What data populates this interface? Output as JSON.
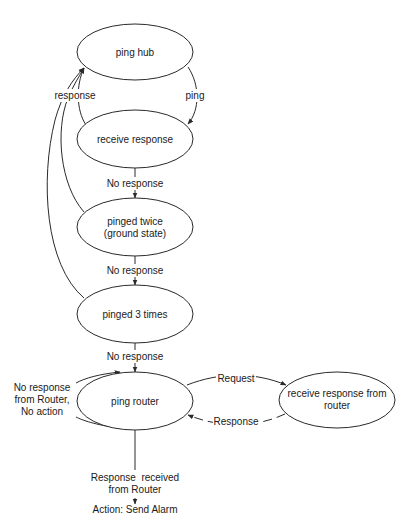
{
  "diagram": {
    "type": "state-machine",
    "nodes": [
      {
        "id": "ping_hub",
        "label": "ping hub"
      },
      {
        "id": "receive_response",
        "label": "receive response"
      },
      {
        "id": "pinged_twice",
        "label_line1": "pinged twice",
        "label_line2": "(ground state)"
      },
      {
        "id": "pinged_3_times",
        "label": "pinged 3 times"
      },
      {
        "id": "ping_router",
        "label": "ping router"
      },
      {
        "id": "receive_response_router",
        "label_line1": "receive response from",
        "label_line2": "router"
      }
    ],
    "edges": [
      {
        "from": "ping_hub",
        "to": "receive_response",
        "label": "ping"
      },
      {
        "from": "receive_response",
        "to": "ping_hub",
        "label": "response"
      },
      {
        "from": "receive_response",
        "to": "pinged_twice",
        "label": "No response"
      },
      {
        "from": "pinged_twice",
        "to": "ping_hub",
        "label": "response"
      },
      {
        "from": "pinged_twice",
        "to": "pinged_3_times",
        "label": "No response"
      },
      {
        "from": "pinged_3_times",
        "to": "ping_hub",
        "label": "response"
      },
      {
        "from": "pinged_3_times",
        "to": "ping_router",
        "label": "No response"
      },
      {
        "from": "ping_router",
        "to": "receive_response_router",
        "label": "Request",
        "style": "solid"
      },
      {
        "from": "receive_response_router",
        "to": "ping_router",
        "label": "Response",
        "style": "dashed"
      },
      {
        "from": "ping_router",
        "to": "ping_router",
        "label_line1": "No response",
        "label_line2": "from Router,",
        "label_line3": "No action"
      }
    ],
    "terminal": {
      "line1": "Response  received",
      "line2": "from Router",
      "line3": "Action: Send Alarm"
    }
  }
}
